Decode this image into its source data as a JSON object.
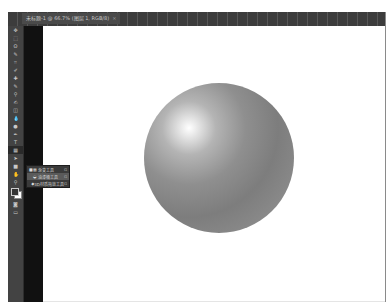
{
  "document_tab": {
    "title": "未标题-1 @ 66.7% (图层 1, RGB/8)",
    "close": "×"
  },
  "toolbar": {
    "tools": [
      {
        "name": "move-tool",
        "glyph": "✥"
      },
      {
        "name": "marquee-tool",
        "glyph": "⬚"
      },
      {
        "name": "lasso-tool",
        "glyph": "ʘ"
      },
      {
        "name": "quick-select-tool",
        "glyph": "✎"
      },
      {
        "name": "crop-tool",
        "glyph": "⌗"
      },
      {
        "name": "eyedropper-tool",
        "glyph": "✐"
      },
      {
        "name": "healing-brush-tool",
        "glyph": "✚"
      },
      {
        "name": "brush-tool",
        "glyph": "✎"
      },
      {
        "name": "clone-stamp-tool",
        "glyph": "⚲"
      },
      {
        "name": "history-brush-tool",
        "glyph": "✍"
      },
      {
        "name": "eraser-tool",
        "glyph": "◫"
      },
      {
        "name": "gradient-tool",
        "glyph": "▦"
      },
      {
        "name": "blur-tool",
        "glyph": "💧"
      },
      {
        "name": "dodge-tool",
        "glyph": "●"
      },
      {
        "name": "pen-tool",
        "glyph": "✒"
      },
      {
        "name": "type-tool",
        "glyph": "T"
      },
      {
        "name": "path-select-tool",
        "glyph": "➤"
      },
      {
        "name": "shape-tool",
        "glyph": "■"
      },
      {
        "name": "hand-tool",
        "glyph": "✋"
      },
      {
        "name": "zoom-tool",
        "glyph": "⚲"
      }
    ],
    "active_index": 11,
    "quick_mask_glyph": "◙",
    "screen_mode_glyph": "▭"
  },
  "flyout_menu": {
    "items": [
      {
        "label": "渐变工具",
        "shortcut": "G",
        "current": true,
        "highlighted": false
      },
      {
        "label": "油漆桶工具",
        "shortcut": "G",
        "current": false,
        "highlighted": true
      },
      {
        "label": "3D材质拖放工具",
        "shortcut": "G",
        "current": false,
        "highlighted": false
      }
    ]
  },
  "canvas": {
    "background": "#ffffff",
    "object": "gradient-sphere"
  }
}
